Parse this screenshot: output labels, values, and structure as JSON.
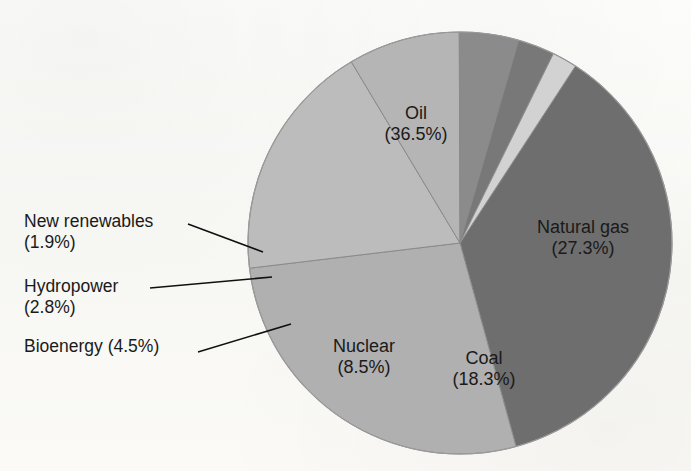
{
  "chart_data": {
    "type": "pie",
    "title": "",
    "subtitle": "",
    "xlabel": "",
    "ylabel": "",
    "legend_position": "none",
    "grid": false,
    "units": "percent",
    "total": 99.8,
    "start_angle_deg": 33,
    "direction": "clockwise",
    "categories": [
      "Oil",
      "Natural gas",
      "Coal",
      "Nuclear",
      "Bioenergy",
      "Hydropower",
      "New renewables"
    ],
    "values": [
      36.5,
      27.3,
      18.3,
      8.5,
      4.5,
      2.8,
      1.9
    ],
    "labels": [
      "Oil (36.5%)",
      "Natural gas (27.3%)",
      "Coal (18.3%)",
      "Nuclear (8.5%)",
      "Bioenergy (4.5%)",
      "Hydropower (2.8%)",
      "New renewables (1.9%)"
    ],
    "colors": [
      "#6e6e6e",
      "#b0b0b0",
      "#bcbcbc",
      "#b5b5b5",
      "#8b8b8b",
      "#787878",
      "#d2d2d2"
    ]
  },
  "slices": [
    {
      "key": "oil",
      "name": "Oil",
      "value": 36.5,
      "value_text": "(36.5%)",
      "color": "#6e6e6e",
      "label_placement": "inside",
      "label_x": 416,
      "label_y": 124
    },
    {
      "key": "natural-gas",
      "name": "Natural gas",
      "value": 27.3,
      "value_text": "(27.3%)",
      "color": "#b0b0b0",
      "label_placement": "inside",
      "label_x": 583,
      "label_y": 238
    },
    {
      "key": "coal",
      "name": "Coal",
      "value": 18.3,
      "value_text": "(18.3%)",
      "color": "#bcbcbc",
      "label_placement": "inside",
      "label_x": 484,
      "label_y": 369
    },
    {
      "key": "nuclear",
      "name": "Nuclear",
      "value": 8.5,
      "value_text": "(8.5%)",
      "color": "#b5b5b5",
      "label_placement": "inside",
      "label_x": 364,
      "label_y": 357
    },
    {
      "key": "bioenergy",
      "name": "Bioenergy",
      "value": 4.5,
      "value_text": "(4.5%)",
      "color": "#8b8b8b",
      "label_placement": "outside",
      "label_x": 24,
      "label_y": 336
    },
    {
      "key": "hydropower",
      "name": "Hydropower",
      "value": 2.8,
      "value_text": "(2.8%)",
      "color": "#787878",
      "label_placement": "outside",
      "label_x": 24,
      "label_y": 276
    },
    {
      "key": "new-renewables",
      "name": "New renewables",
      "value": 1.9,
      "value_text": "(1.9%)",
      "color": "#d2d2d2",
      "label_placement": "outside",
      "label_x": 24,
      "label_y": 211
    }
  ],
  "geometry": {
    "center_x": 460,
    "center_y": 243,
    "radius_x": 212,
    "radius_y": 211,
    "divider_color": "#8a8a8a",
    "outline_color": "#9a9a9a",
    "leader_color": "#101010"
  },
  "leaders": [
    {
      "key": "new-renewables-leader",
      "x1": 188,
      "y1": 224,
      "x2": 263,
      "y2": 252
    },
    {
      "key": "hydropower-leader",
      "x1": 150,
      "y1": 288,
      "x2": 272,
      "y2": 277
    },
    {
      "key": "bioenergy-leader",
      "x1": 198,
      "y1": 352,
      "x2": 291,
      "y2": 324
    }
  ]
}
